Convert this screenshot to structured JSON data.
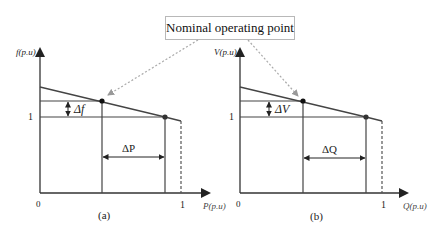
{
  "callout": {
    "label": "Nominal operating point"
  },
  "colors": {
    "line": "#333333",
    "dashed_callout": "#aaaaaa",
    "text": "#111111"
  },
  "diagram_a": {
    "y_axis_label": "f(p.u)",
    "x_axis_label": "P(p.u)",
    "origin_label": "0",
    "x_tick_one": "1",
    "y_tick_one": "1",
    "delta_vertical_label": "Δf",
    "delta_horizontal_label": "ΔP",
    "caption": "(a)"
  },
  "diagram_b": {
    "y_axis_label": "V(p.u)",
    "x_axis_label": "Q(p.u)",
    "origin_label": "0",
    "x_tick_one": "1",
    "y_tick_one": "1",
    "delta_vertical_label": "ΔV",
    "delta_horizontal_label": "ΔQ",
    "caption": "(b)"
  }
}
